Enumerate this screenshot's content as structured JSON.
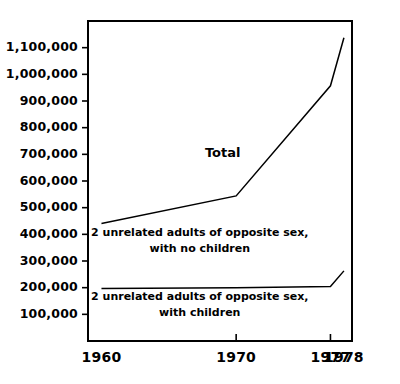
{
  "chart_data": {
    "type": "line",
    "title": "",
    "subtitle": "",
    "xlabel": "",
    "ylabel": "",
    "grid": false,
    "legend_position": "inline-annotations",
    "x": [
      1960,
      1970,
      1977,
      1978
    ],
    "xlim": [
      1959,
      1978.6
    ],
    "ylim": [
      0,
      1200000
    ],
    "xticks": [
      1960,
      1970,
      1977,
      1978
    ],
    "xtick_labels": [
      "1960",
      "1970",
      "1977",
      "1978"
    ],
    "yticks": [
      100000,
      200000,
      300000,
      400000,
      500000,
      600000,
      700000,
      800000,
      900000,
      1000000,
      1100000
    ],
    "ytick_labels": [
      "100,000",
      "200,000",
      "300,000",
      "400,000",
      "500,000",
      "600,000",
      "700,000",
      "800,000",
      "900,000",
      "1,000,000",
      "1,100,000"
    ],
    "series": [
      {
        "name": "Total",
        "annotation": "Total",
        "values": [
          441000,
          544000,
          957000,
          1137000
        ]
      },
      {
        "name": "2 unrelated adults of opposite sex, with no children",
        "annotation_line1": "2 unrelated adults of opposite sex,",
        "annotation_line2": "with no children",
        "values": [
          null,
          null,
          null,
          null
        ]
      },
      {
        "name": "2 unrelated adults of opposite sex, with children",
        "annotation_line1": "2 unrelated adults of opposite sex,",
        "annotation_line2": "with children",
        "values": [
          197000,
          200000,
          204000,
          263000
        ]
      }
    ],
    "annotations": [
      {
        "id": "total",
        "text": "Total",
        "x": 1969.0,
        "y": 690000
      },
      {
        "id": "no-children-line1",
        "text": "2 unrelated adults of opposite sex,",
        "x": 1967.3,
        "y": 392000
      },
      {
        "id": "no-children-line2",
        "text": "with no children",
        "x": 1967.3,
        "y": 332000
      },
      {
        "id": "with-children-line1",
        "text": "2 unrelated adults of opposite sex,",
        "x": 1967.3,
        "y": 152000
      },
      {
        "id": "with-children-line2",
        "text": "with children",
        "x": 1967.3,
        "y": 92000
      }
    ],
    "colors": {
      "background": "#ffffff",
      "line": "#000000",
      "axis": "#000000",
      "text": "#000000"
    }
  }
}
